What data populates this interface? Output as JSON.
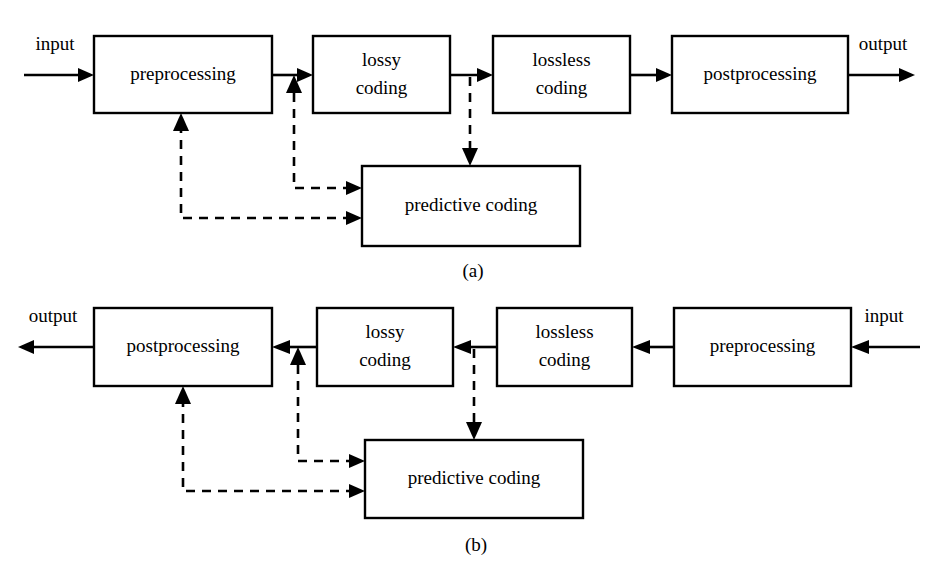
{
  "figure": {
    "type": "block-diagram",
    "title": "",
    "panels": [
      {
        "id": "a",
        "caption": "(a)",
        "direction": "encoder-left-to-right",
        "nodes": [
          {
            "id": "a-preprocessing",
            "label": "preprocessing",
            "x": 94,
            "y": 36,
            "w": 178,
            "h": 77
          },
          {
            "id": "a-lossy-coding",
            "label": "lossy\ncoding",
            "line1": "lossy",
            "line2": "coding",
            "x": 313,
            "y": 36,
            "w": 137,
            "h": 77
          },
          {
            "id": "a-lossless-coding",
            "label": "lossless\ncoding",
            "line1": "lossless",
            "line2": "coding",
            "x": 493,
            "y": 36,
            "w": 137,
            "h": 77
          },
          {
            "id": "a-postprocessing",
            "label": "postprocessing",
            "x": 672,
            "y": 36,
            "w": 176,
            "h": 77
          },
          {
            "id": "a-predictive-coding",
            "label": "predictive coding",
            "x": 362,
            "y": 166,
            "w": 218,
            "h": 80
          }
        ],
        "io": [
          {
            "id": "a-input",
            "label": "input",
            "x": 55,
            "y": 50
          },
          {
            "id": "a-output",
            "label": "output",
            "x": 883,
            "y": 50
          }
        ],
        "edges": [
          {
            "from": "input",
            "to": "preprocessing",
            "style": "solid"
          },
          {
            "from": "preprocessing",
            "to": "lossy-coding",
            "style": "solid"
          },
          {
            "from": "lossy-coding",
            "to": "lossless-coding",
            "style": "solid"
          },
          {
            "from": "lossless-coding",
            "to": "postprocessing",
            "style": "solid"
          },
          {
            "from": "postprocessing",
            "to": "output",
            "style": "solid"
          },
          {
            "from": "lossy-coding",
            "to": "predictive-coding",
            "style": "dashed"
          },
          {
            "from": "predictive-coding",
            "to": "lossy-coding",
            "style": "dashed"
          },
          {
            "from": "predictive-coding",
            "to": "preprocessing",
            "style": "dashed"
          }
        ]
      },
      {
        "id": "b",
        "caption": "(b)",
        "direction": "decoder-right-to-left",
        "nodes": [
          {
            "id": "b-postprocessing",
            "label": "postprocessing",
            "x": 94,
            "y": 308,
            "w": 178,
            "h": 78
          },
          {
            "id": "b-lossy-coding",
            "label": "lossy\ncoding",
            "line1": "lossy",
            "line2": "coding",
            "x": 317,
            "y": 308,
            "w": 136,
            "h": 78
          },
          {
            "id": "b-lossless-coding",
            "label": "lossless\ncoding",
            "line1": "lossless",
            "line2": "coding",
            "x": 497,
            "y": 308,
            "w": 135,
            "h": 78
          },
          {
            "id": "b-preprocessing",
            "label": "preprocessing",
            "x": 674,
            "y": 308,
            "w": 177,
            "h": 78
          },
          {
            "id": "b-predictive-coding",
            "label": "predictive coding",
            "x": 365,
            "y": 440,
            "w": 218,
            "h": 78
          }
        ],
        "io": [
          {
            "id": "b-output",
            "label": "output",
            "x": 53,
            "y": 322
          },
          {
            "id": "b-input",
            "label": "input",
            "x": 884,
            "y": 322
          }
        ],
        "edges": [
          {
            "from": "input",
            "to": "preprocessing",
            "style": "solid"
          },
          {
            "from": "preprocessing",
            "to": "lossless-coding",
            "style": "solid"
          },
          {
            "from": "lossless-coding",
            "to": "lossy-coding",
            "style": "solid"
          },
          {
            "from": "lossy-coding",
            "to": "postprocessing",
            "style": "solid"
          },
          {
            "from": "postprocessing",
            "to": "output",
            "style": "solid"
          },
          {
            "from": "lossless-coding",
            "to": "predictive-coding",
            "style": "dashed"
          },
          {
            "from": "predictive-coding",
            "to": "lossy-coding",
            "style": "dashed"
          },
          {
            "from": "predictive-coding",
            "to": "postprocessing",
            "style": "dashed"
          }
        ]
      }
    ],
    "colors": {
      "stroke": "#000000",
      "background": "#ffffff",
      "text": "#000000"
    }
  }
}
